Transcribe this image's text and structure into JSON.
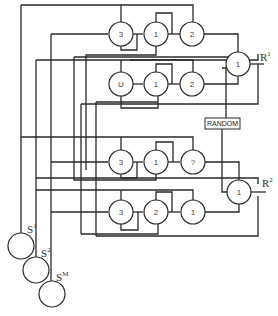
{
  "diagram": {
    "type": "neural-network-schematic",
    "rows": [
      {
        "nodes": [
          "3",
          "1",
          "2"
        ]
      },
      {
        "nodes": [
          "U",
          "1",
          "2"
        ]
      },
      {
        "nodes": [
          "3",
          "1",
          "?"
        ]
      },
      {
        "nodes": [
          "3",
          "2",
          "1"
        ]
      }
    ],
    "output_nodes": [
      {
        "value": "1",
        "label": "R",
        "sup": "1"
      },
      {
        "value": "1",
        "label": "R",
        "sup": "2"
      }
    ],
    "random_box": "RANDOM",
    "sensors": [
      {
        "label": "S",
        "sup": "1"
      },
      {
        "label": "S",
        "sup": "2"
      },
      {
        "label": "S",
        "sup": "M"
      }
    ]
  }
}
